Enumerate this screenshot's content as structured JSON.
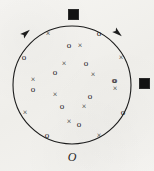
{
  "figure": {
    "background_color": "#f2f1ee",
    "ink_color": "#1c1c1c",
    "width": 154,
    "height": 171,
    "origin_label": "O",
    "caption": ""
  },
  "circle": {
    "name": "boundary-circle",
    "center_x": 72,
    "center_y": 85,
    "radius": 59,
    "stroke_color": "#1c1c1c",
    "stroke_width": 1.1,
    "fill": "none"
  },
  "squares": [
    {
      "id": "square-top",
      "label": "filled-square",
      "x": 68,
      "y": 9,
      "size": 9
    },
    {
      "id": "square-right",
      "label": "filled-square",
      "x": 139,
      "y": 78,
      "size": 9
    }
  ],
  "arrowheads": [
    {
      "id": "arrow-upper-left",
      "label": "filled-arrowhead",
      "x": 26,
      "y": 33,
      "rotation": -40
    },
    {
      "id": "arrow-upper-right",
      "label": "filled-arrowhead",
      "x": 118,
      "y": 33,
      "rotation": 40
    }
  ],
  "markers": {
    "circles_symbol": "o",
    "crosses_symbol": "×",
    "circle_points": [
      {
        "x": 99,
        "y": 33
      },
      {
        "x": 24,
        "y": 57
      },
      {
        "x": 69,
        "y": 45
      },
      {
        "x": 86,
        "y": 63
      },
      {
        "x": 55,
        "y": 72
      },
      {
        "x": 33,
        "y": 89
      },
      {
        "x": 115,
        "y": 80
      },
      {
        "x": 90,
        "y": 96
      },
      {
        "x": 62,
        "y": 106
      },
      {
        "x": 123,
        "y": 112
      },
      {
        "x": 79,
        "y": 124
      },
      {
        "x": 47,
        "y": 135
      },
      {
        "x": 114,
        "y": 80
      }
    ],
    "cross_points": [
      {
        "x": 48,
        "y": 34
      },
      {
        "x": 80,
        "y": 46
      },
      {
        "x": 121,
        "y": 58
      },
      {
        "x": 64,
        "y": 64
      },
      {
        "x": 93,
        "y": 75
      },
      {
        "x": 33,
        "y": 80
      },
      {
        "x": 115,
        "y": 89
      },
      {
        "x": 55,
        "y": 95
      },
      {
        "x": 84,
        "y": 107
      },
      {
        "x": 25,
        "y": 113
      },
      {
        "x": 69,
        "y": 122
      },
      {
        "x": 99,
        "y": 136
      }
    ]
  }
}
